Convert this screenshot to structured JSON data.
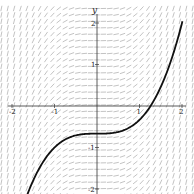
{
  "chart_data": {
    "type": "line",
    "title": "",
    "subtitle": "Slope field with solution curve",
    "xlabel": "",
    "ylabel": "y",
    "xlim": [
      -2,
      2
    ],
    "ylim": [
      -2,
      2
    ],
    "x_ticks": [
      "-2",
      "-1",
      "1",
      "2"
    ],
    "y_ticks": [
      "2",
      "1",
      "-1",
      "-2"
    ],
    "grid": false,
    "slope_field": {
      "equation": "dy/dx = x^2",
      "color": "#9a9a9a"
    },
    "series": [
      {
        "name": "solution curve",
        "formula": "y = x^3/3 - 2/3",
        "color": "#111111",
        "x": [
          -1.62,
          -1.5,
          -1.0,
          -0.5,
          0.0,
          0.5,
          1.0,
          1.26,
          1.5,
          2.0
        ],
        "y": [
          -2.08,
          -1.79,
          -1.0,
          -0.71,
          -0.67,
          -0.62,
          -0.33,
          0.0,
          0.46,
          2.0
        ]
      }
    ]
  }
}
